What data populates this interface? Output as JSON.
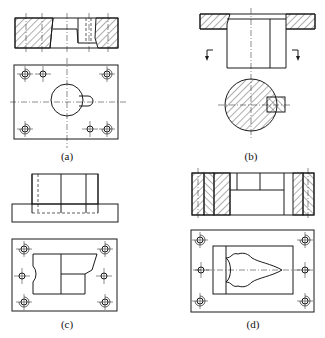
{
  "figure": {
    "panels": [
      {
        "id": "a",
        "label": "(a)",
        "description": "Section view and plan view of die plate with round opening and keyhole slot, six bolt/pin holes"
      },
      {
        "id": "b",
        "label": "(b)",
        "description": "Flanged punch section view with cutting-plane arrows and circular cross-section with key"
      },
      {
        "id": "c",
        "label": "(c)",
        "description": "Front view with hidden lines and plan view of plate with stepped profile opening, six holes"
      },
      {
        "id": "d",
        "label": "(d)",
        "description": "Sectioned assembly view and plan view of plate with symmetric profiled cavity, six holes"
      }
    ],
    "colors": {
      "line": "#1a1a1a",
      "background": "#ffffff"
    }
  }
}
